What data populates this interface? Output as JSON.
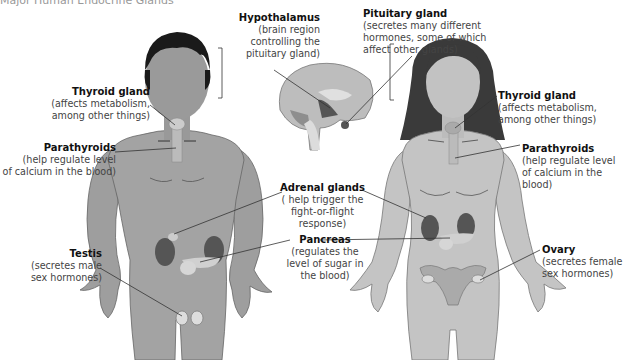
{
  "header": {
    "cutoff_text": "Major Human Endocrine Glands"
  },
  "labels": {
    "hypothalamus": {
      "title": "Hypothalamus",
      "desc": [
        "(brain region",
        "controlling the",
        "pituitary gland)"
      ]
    },
    "pituitary": {
      "title": "Pituitary gland",
      "desc": [
        "(secretes many different",
        "hormones, some of which",
        "affect other glands)"
      ]
    },
    "thyroid_male": {
      "title": "Thyroid gland",
      "desc": [
        "(affects metabolism,",
        "among other things)"
      ]
    },
    "parathyroids_male": {
      "title": "Parathyroids",
      "desc": [
        "(help regulate level",
        "of calcium in the blood)"
      ]
    },
    "thyroid_female": {
      "title": "Thyroid gland",
      "desc": [
        "(affects metabolism,",
        "among other things)"
      ]
    },
    "parathyroids_female": {
      "title": "Parathyroids",
      "desc": [
        "(help regulate level",
        "of calcium in the blood)"
      ]
    },
    "adrenal": {
      "title": "Adrenal glands",
      "desc": [
        "( help trigger the",
        "fight-or-flight",
        "response)"
      ]
    },
    "pancreas": {
      "title": "Pancreas",
      "desc": [
        "(regulates the",
        "level of sugar in",
        "the blood)"
      ]
    },
    "testis": {
      "title": "Testis",
      "desc": [
        "(secretes male",
        "sex hormones)"
      ]
    },
    "ovary": {
      "title": "Ovary",
      "desc": [
        "(secretes female",
        "sex hormones)"
      ]
    }
  },
  "figures": {
    "male": "male-body",
    "female": "female-body",
    "brain": "brain-cross-section"
  },
  "colors": {
    "skin_male": "#a3a3a3",
    "skin_female": "#c4c4c4",
    "hair": "#1a1a1a",
    "hair_female": "#3a3a3a",
    "organ_dark": "#555555",
    "leader_line": "#333333"
  }
}
